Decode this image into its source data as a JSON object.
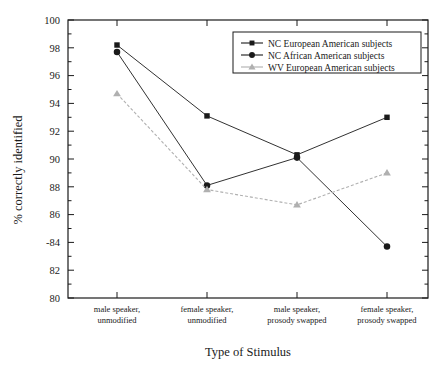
{
  "chart_data": {
    "type": "line",
    "title": "",
    "xlabel": "Type of Stimulus",
    "ylabel": "% correctly identified",
    "categories": [
      "male speaker, unmodified",
      "female speaker, unmodified",
      "male speaker, prosody swapped",
      "female speaker, prosody swapped"
    ],
    "category_lines": [
      [
        "male speaker,",
        "unmodified"
      ],
      [
        "female speaker,",
        "unmodified"
      ],
      [
        "male speaker,",
        "prosody swapped"
      ],
      [
        "female speaker,",
        "prosody swapped"
      ]
    ],
    "ylim": [
      80,
      100
    ],
    "yticks": [
      80,
      82,
      84,
      86,
      88,
      90,
      92,
      94,
      96,
      98,
      100
    ],
    "ytick_labels": [
      "80",
      "82",
      "-84",
      "86",
      "88",
      "90",
      "92",
      "94",
      "96",
      "98",
      "100"
    ],
    "grid": false,
    "legend_position": "top-right",
    "series": [
      {
        "name": "NC European American subjects",
        "marker": "square",
        "color": "#1a1a1a",
        "values": [
          98.2,
          93.1,
          90.3,
          93.0
        ]
      },
      {
        "name": "NC African American subjects",
        "marker": "circle",
        "color": "#1a1a1a",
        "values": [
          97.7,
          88.1,
          90.1,
          83.7
        ]
      },
      {
        "name": "WV European American subjects",
        "marker": "triangle",
        "color": "#b0b0b0",
        "values": [
          94.7,
          87.8,
          86.7,
          89.0
        ]
      }
    ]
  },
  "axis": {
    "xlabel": "Type of Stimulus",
    "ylabel": "% correctly identified"
  },
  "legend": {
    "entries": [
      {
        "label": "NC European American subjects",
        "marker": "square-marker",
        "color": "#1a1a1a"
      },
      {
        "label": "NC African American subjects",
        "marker": "circle-marker",
        "color": "#1a1a1a"
      },
      {
        "label": "WV European American subjects",
        "marker": "triangle-marker",
        "color": "#b0b0b0"
      }
    ]
  },
  "colors": {
    "axis": "#1a1a1a",
    "series_dark": "#1a1a1a",
    "series_light": "#b0b0b0",
    "background": "#ffffff"
  }
}
